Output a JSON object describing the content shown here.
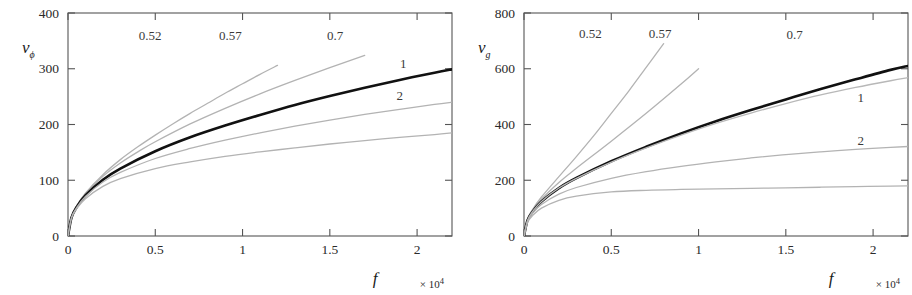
{
  "figure": {
    "background": "#ffffff",
    "panel_count": 2
  },
  "chart_data": [
    {
      "type": "line",
      "panel": "left",
      "title": "",
      "xlabel": "f",
      "ylabel": "v_phi",
      "ylabel_display": "v",
      "ylabel_sub": "ϕ",
      "x_multiplier": "× 10",
      "x_multiplier_exp": "4",
      "xlim": [
        0,
        2.2
      ],
      "ylim": [
        0,
        400
      ],
      "xticks": [
        0,
        0.5,
        1,
        1.5,
        2
      ],
      "xticklabels": [
        "0",
        "0.5",
        "1",
        "1.5",
        "2"
      ],
      "yticks": [
        0,
        100,
        200,
        300,
        400
      ],
      "yticklabels": [
        "0",
        "100",
        "200",
        "300",
        "400"
      ],
      "grid": false,
      "legend": "inline-curve-labels",
      "series": [
        {
          "name": "0.52",
          "label": "0.52",
          "color": "#b3b3b3",
          "width": 1.3,
          "x": [
            0,
            0.02,
            0.05,
            0.1,
            0.2,
            0.3,
            0.4,
            0.5,
            0.6,
            0.7,
            0.8,
            0.9,
            1.0,
            1.1,
            1.2
          ],
          "y": [
            0,
            34,
            54,
            77,
            110,
            137,
            160,
            181,
            201,
            220,
            238,
            256,
            273,
            290,
            306
          ]
        },
        {
          "name": "0.57",
          "label": "0.57",
          "color": "#b3b3b3",
          "width": 1.3,
          "x": [
            0,
            0.02,
            0.05,
            0.1,
            0.2,
            0.3,
            0.4,
            0.5,
            0.7,
            0.9,
            1.1,
            1.3,
            1.5,
            1.7
          ],
          "y": [
            0,
            34,
            54,
            76,
            107,
            131,
            151,
            169,
            201,
            229,
            255,
            279,
            302,
            324
          ]
        },
        {
          "name": "0.7",
          "label": "0.7",
          "color": "#111111",
          "width": 2.6,
          "x": [
            0,
            0.02,
            0.05,
            0.1,
            0.2,
            0.3,
            0.5,
            0.7,
            0.9,
            1.1,
            1.3,
            1.5,
            1.7,
            1.9,
            2.1,
            2.2
          ],
          "y": [
            0,
            33,
            52,
            73,
            101,
            121,
            152,
            177,
            198,
            217,
            235,
            251,
            266,
            280,
            293,
            299
          ]
        },
        {
          "name": "1",
          "label": "1",
          "color": "#b3b3b3",
          "width": 1.3,
          "x": [
            0,
            0.02,
            0.05,
            0.1,
            0.2,
            0.3,
            0.5,
            0.7,
            0.9,
            1.1,
            1.3,
            1.5,
            1.7,
            1.9,
            2.1,
            2.2
          ],
          "y": [
            0,
            33,
            51,
            71,
            97,
            114,
            139,
            157,
            172,
            185,
            197,
            208,
            218,
            227,
            236,
            240
          ]
        },
        {
          "name": "2",
          "label": "2",
          "color": "#b3b3b3",
          "width": 1.3,
          "x": [
            0,
            0.02,
            0.05,
            0.1,
            0.2,
            0.3,
            0.5,
            0.7,
            0.9,
            1.1,
            1.3,
            1.5,
            1.7,
            1.9,
            2.1,
            2.2
          ],
          "y": [
            0,
            32,
            49,
            67,
            89,
            103,
            121,
            133,
            143,
            151,
            158,
            165,
            171,
            177,
            182,
            185
          ]
        }
      ],
      "curve_label_positions": [
        {
          "label": "0.52",
          "x": 0.47,
          "y": 352
        },
        {
          "label": "0.57",
          "x": 0.93,
          "y": 352
        },
        {
          "label": "0.7",
          "x": 1.53,
          "y": 352
        },
        {
          "label": "1",
          "x": 1.92,
          "y": 302
        },
        {
          "label": "2",
          "x": 1.9,
          "y": 244
        }
      ]
    },
    {
      "type": "line",
      "panel": "right",
      "title": "",
      "xlabel": "f",
      "ylabel": "v_g",
      "ylabel_display": "v",
      "ylabel_sub": "g",
      "x_multiplier": "× 10",
      "x_multiplier_exp": "4",
      "xlim": [
        0,
        2.2
      ],
      "ylim": [
        0,
        800
      ],
      "xticks": [
        0,
        0.5,
        1,
        1.5,
        2
      ],
      "xticklabels": [
        "0",
        "0.5",
        "1",
        "1.5",
        "2"
      ],
      "yticks": [
        0,
        200,
        400,
        600,
        800
      ],
      "yticklabels": [
        "0",
        "200",
        "400",
        "600",
        "800"
      ],
      "grid": false,
      "legend": "inline-curve-labels",
      "series": [
        {
          "name": "0.52",
          "label": "0.52",
          "color": "#b3b3b3",
          "width": 1.3,
          "x": [
            0,
            0.02,
            0.05,
            0.1,
            0.2,
            0.3,
            0.4,
            0.5,
            0.6,
            0.7,
            0.8
          ],
          "y": [
            0,
            60,
            96,
            140,
            213,
            285,
            360,
            440,
            520,
            605,
            690
          ]
        },
        {
          "name": "0.57",
          "label": "0.57",
          "color": "#b3b3b3",
          "width": 1.3,
          "x": [
            0,
            0.02,
            0.05,
            0.1,
            0.2,
            0.3,
            0.5,
            0.7,
            0.9,
            1.0
          ],
          "y": [
            0,
            58,
            92,
            132,
            192,
            243,
            340,
            440,
            545,
            600
          ]
        },
        {
          "name": "0.7",
          "label": "0.7",
          "color": "#111111",
          "width": 2.6,
          "x": [
            0,
            0.02,
            0.05,
            0.1,
            0.2,
            0.3,
            0.5,
            0.7,
            0.9,
            1.1,
            1.3,
            1.5,
            1.7,
            1.9,
            2.1,
            2.2
          ],
          "y": [
            0,
            56,
            88,
            124,
            172,
            208,
            268,
            320,
            368,
            412,
            452,
            490,
            527,
            562,
            596,
            610
          ]
        },
        {
          "name": "0.7-gray",
          "label": "",
          "color": "#b8b8b8",
          "width": 1.3,
          "x": [
            0,
            0.02,
            0.05,
            0.1,
            0.2,
            0.3,
            0.5,
            0.7,
            0.9,
            1.1,
            1.3,
            1.5,
            1.7,
            1.9,
            2.1,
            2.2
          ],
          "y": [
            0,
            56,
            88,
            124,
            172,
            207,
            265,
            316,
            362,
            404,
            441,
            475,
            506,
            533,
            557,
            568
          ]
        },
        {
          "name": "1",
          "label": "1",
          "color": "#b3b3b3",
          "width": 1.3,
          "x": [
            0,
            0.02,
            0.05,
            0.1,
            0.2,
            0.3,
            0.5,
            0.7,
            0.9,
            1.1,
            1.3,
            1.5,
            1.7,
            1.9,
            2.1,
            2.2
          ],
          "y": [
            0,
            52,
            82,
            113,
            150,
            174,
            207,
            231,
            250,
            266,
            280,
            292,
            302,
            311,
            318,
            321
          ]
        },
        {
          "name": "2",
          "label": "2",
          "color": "#b3b3b3",
          "width": 1.3,
          "x": [
            0,
            0.02,
            0.05,
            0.1,
            0.2,
            0.3,
            0.5,
            0.7,
            0.9,
            1.1,
            1.3,
            1.5,
            1.7,
            1.9,
            2.1,
            2.2
          ],
          "y": [
            0,
            48,
            74,
            100,
            128,
            143,
            158,
            164,
            167,
            169,
            171,
            173,
            175,
            177,
            179,
            180
          ]
        }
      ],
      "curve_label_positions": [
        {
          "label": "0.52",
          "x": 0.38,
          "y": 710
        },
        {
          "label": "0.57",
          "x": 0.78,
          "y": 710
        },
        {
          "label": "0.7",
          "x": 1.55,
          "y": 705
        },
        {
          "label": "1",
          "x": 1.93,
          "y": 480
        },
        {
          "label": "2",
          "x": 1.93,
          "y": 325
        }
      ]
    }
  ]
}
